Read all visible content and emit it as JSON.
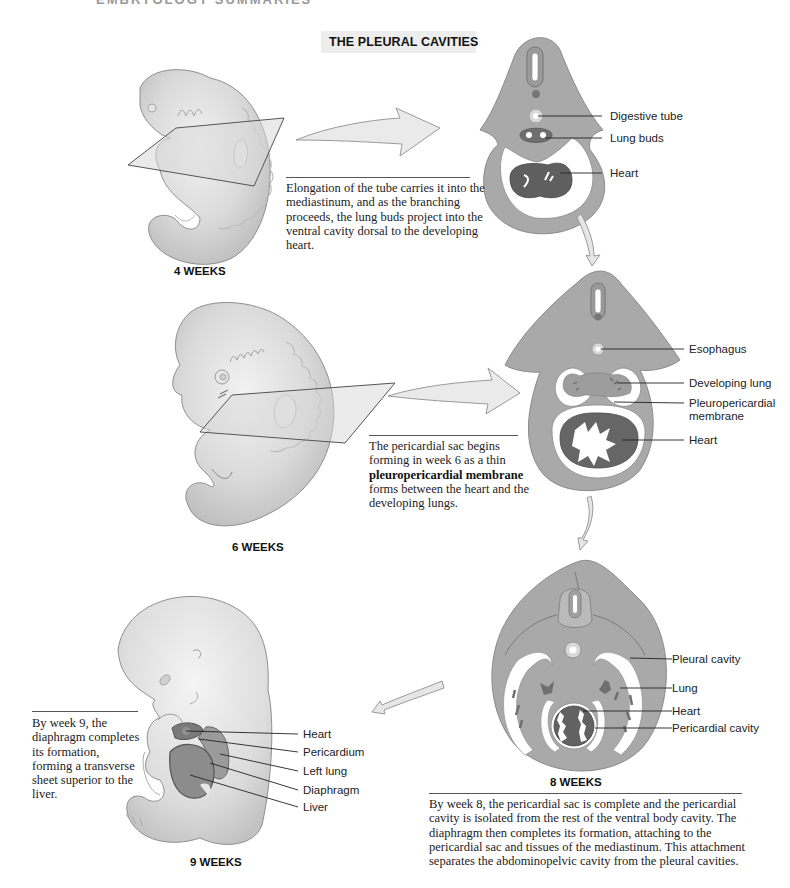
{
  "header": {
    "cut_off_running_head": "EMBRYOLOGY SUMMARIES",
    "title": "THE PLEURAL CAVITIES"
  },
  "stages": [
    {
      "week_label": "4 WEEKS",
      "caption": "Elongation of the tube carries it into the mediastinum, and as the branching proceeds, the lung buds project into the ventral cavity dorsal to the developing heart.",
      "labels": [
        "Digestive tube",
        "Lung buds",
        "Heart"
      ]
    },
    {
      "week_label": "6 WEEKS",
      "caption_pre": "The pericardial sac begins forming in week 6 as a thin",
      "caption_bold": "pleuropericardial membrane",
      "caption_post": "forms between the heart and the developing lungs.",
      "labels": [
        "Esophagus",
        "Developing lung",
        "Pleuropericardial",
        "membrane",
        "Heart"
      ]
    },
    {
      "week_label": "8 WEEKS",
      "caption": "By week 8, the pericardial sac is complete and the pericardial cavity is isolated from the rest of the ventral body cavity. The diaphragm then completes its formation, attaching to the pericardial sac and tissues of the mediastinum. This attachment separates the abdominopelvic cavity from the pleural cavities.",
      "labels": [
        "Pleural cavity",
        "Lung",
        "Heart",
        "Pericardial cavity"
      ]
    },
    {
      "week_label": "9 WEEKS",
      "caption": "By week 9, the diaphragm completes its formation, forming a transverse sheet superior to the liver.",
      "labels": [
        "Heart",
        "Pericardium",
        "Left lung",
        "Diaphragm",
        "Liver"
      ]
    }
  ],
  "colors": {
    "section_tissue": "#a9a9a9",
    "section_outline": "#8a8a8a",
    "organ_dark": "#6b6b6b",
    "cavity": "#ffffff",
    "embryo_skin": "#dcdcdc",
    "arrow_fill": "#e9e9e9",
    "title_box": "#ededed"
  }
}
